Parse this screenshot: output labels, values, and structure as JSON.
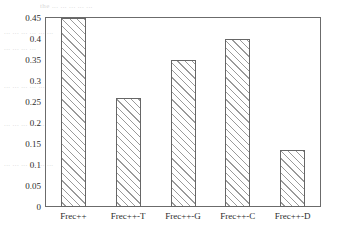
{
  "chart_data": {
    "type": "bar",
    "title": "",
    "subtitle": "",
    "xlabel": "",
    "ylabel": "",
    "categories": [
      "Frec++",
      "Frec++-T",
      "Frec++-G",
      "Frec++-C",
      "Frec++-D"
    ],
    "values": [
      0.45,
      0.26,
      0.35,
      0.4,
      0.135
    ],
    "series": [
      {
        "name": "",
        "values": [
          0.45,
          0.26,
          0.35,
          0.4,
          0.135
        ]
      }
    ],
    "ylim": [
      0,
      0.45
    ],
    "ytick_labels": [
      "0",
      "0.05",
      "0.1",
      "0.15",
      "0.2",
      "0.25",
      "0.3",
      "0.35",
      "0.4",
      "0.45"
    ],
    "ytick_values": [
      0,
      0.05,
      0.1,
      0.15,
      0.2,
      0.25,
      0.3,
      0.35,
      0.4,
      0.45
    ],
    "grid": false,
    "legend": null,
    "legend_position": "none",
    "annotations": [],
    "bar_fill": "diagonal-hatch",
    "bar_fill_color": "#9a9a9a",
    "bar_edge_color": "#666666",
    "axis_color": "#6b6b6b",
    "background_color": "#ffffff",
    "text_color": "#2b2b2b"
  },
  "ghost_text": {
    "line1": "the  ...  ...  ...  ...  ...",
    "line2": "...  ...  ...  ...  ...  ...",
    "line3": "...  ...  ...  ...",
    "line4": "...  ...  ...  ...  ...",
    "line5": "...  ...  ...  ...  ...",
    "line6": "...  ...  ...  ...  ...  ..."
  }
}
